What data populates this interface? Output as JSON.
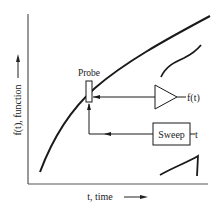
{
  "diagram": {
    "y_axis_label": "f(t), function",
    "x_axis_label": "t, time",
    "probe_label": "Probe",
    "amplifier_output_label": "f(t)",
    "sweep_label": "Sweep",
    "sweep_output_label": "t",
    "colors": {
      "ink": "#1a1a1a",
      "axis": "#555555",
      "background": "#ffffff"
    },
    "icons": [
      "arrow-right-icon",
      "arrow-up-icon",
      "amplifier-triangle-icon"
    ]
  }
}
